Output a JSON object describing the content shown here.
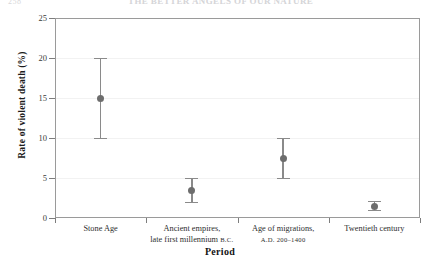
{
  "page": {
    "folio": "258",
    "running_head": "THE BETTER ANGELS OF OUR NATURE"
  },
  "chart_data": {
    "type": "scatter",
    "title": "",
    "xlabel": "Period",
    "ylabel": "Rate of violent death (%)",
    "ylim": [
      0,
      25
    ],
    "yticks": [
      0,
      5,
      10,
      15,
      20,
      25
    ],
    "ytick_labels": [
      "0",
      "5",
      "10",
      "15",
      "20",
      "25"
    ],
    "grid": true,
    "legend": "none",
    "marker_color": "#6d6d6d",
    "errorbar_color": "#8a8a8a",
    "categories": [
      {
        "line1": "Stone Age",
        "line2": "",
        "line2_smallcaps": ""
      },
      {
        "line1": "Ancient empires,",
        "line2": "late first millennium ",
        "line2_smallcaps": "B.C."
      },
      {
        "line1": "Age of migrations,",
        "line2": "",
        "line2_smallcaps": "A.D. 200–1400"
      },
      {
        "line1": "Twentieth century",
        "line2": "",
        "line2_smallcaps": ""
      }
    ],
    "values": [
      15.0,
      3.4,
      7.5,
      1.5
    ],
    "err_low": [
      10.0,
      2.0,
      5.0,
      1.0
    ],
    "err_high": [
      20.0,
      5.0,
      10.0,
      2.1
    ]
  }
}
